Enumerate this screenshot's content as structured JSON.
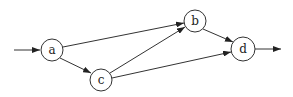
{
  "diagram": {
    "type": "directed-graph",
    "nodes": [
      {
        "id": "a",
        "label": "a",
        "x": 52,
        "y": 50,
        "r": 11
      },
      {
        "id": "b",
        "label": "b",
        "x": 195,
        "y": 21,
        "r": 11
      },
      {
        "id": "c",
        "label": "c",
        "x": 101,
        "y": 80,
        "r": 11
      },
      {
        "id": "d",
        "label": "d",
        "x": 243,
        "y": 49,
        "r": 12
      }
    ],
    "edges": [
      {
        "from": "input",
        "to": "a"
      },
      {
        "from": "a",
        "to": "b"
      },
      {
        "from": "a",
        "to": "c"
      },
      {
        "from": "c",
        "to": "b"
      },
      {
        "from": "c",
        "to": "d"
      },
      {
        "from": "b",
        "to": "d"
      },
      {
        "from": "d",
        "to": "output"
      }
    ]
  }
}
